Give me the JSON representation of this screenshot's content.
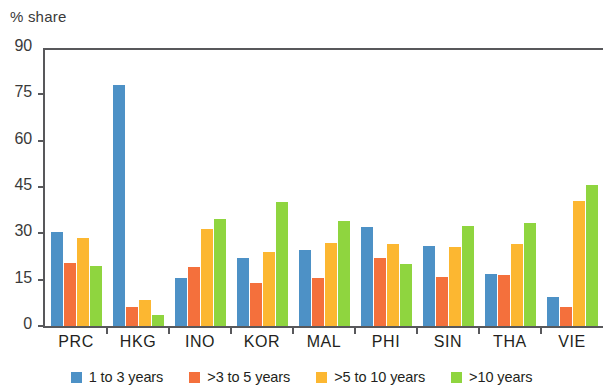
{
  "chart_data": {
    "type": "bar",
    "title": "% share",
    "xlabel": "",
    "ylabel": "% share",
    "ylim": [
      0,
      90
    ],
    "yticks": [
      0,
      15,
      30,
      45,
      60,
      75,
      90
    ],
    "ytick_labels": [
      "0",
      "15",
      "30",
      "45",
      "60",
      "75",
      "90"
    ],
    "grid": false,
    "legend_position": "bottom",
    "categories": [
      "PRC",
      "HKG",
      "INO",
      "KOR",
      "MAL",
      "PHI",
      "SIN",
      "THA",
      "VIE"
    ],
    "series": [
      {
        "name": "1 to 3 years",
        "color": "#4d91c6",
        "values": [
          30.5,
          78.0,
          15.5,
          22.0,
          24.5,
          32.0,
          26.0,
          17.0,
          9.5
        ]
      },
      {
        "name": ">3 to 5 years",
        "color": "#f4703c",
        "values": [
          20.5,
          6.0,
          19.0,
          14.0,
          15.5,
          22.0,
          16.0,
          16.5,
          6.0
        ]
      },
      {
        "name": ">5 to 10 years",
        "color": "#fcb731",
        "values": [
          28.5,
          8.5,
          31.5,
          24.0,
          27.0,
          26.5,
          25.5,
          26.5,
          40.5
        ]
      },
      {
        "name": ">10 years",
        "color": "#8fd53f",
        "values": [
          19.5,
          3.5,
          34.5,
          40.0,
          34.0,
          20.0,
          32.5,
          33.5,
          45.5
        ]
      }
    ]
  },
  "legend": {
    "items": [
      {
        "label": "1 to 3 years",
        "color": "#4d91c6"
      },
      {
        "label": ">3 to 5 years",
        "color": "#f4703c"
      },
      {
        "label": ">5 to 10 years",
        "color": "#fcb731"
      },
      {
        "label": ">10 years",
        "color": "#8fd53f"
      }
    ]
  }
}
